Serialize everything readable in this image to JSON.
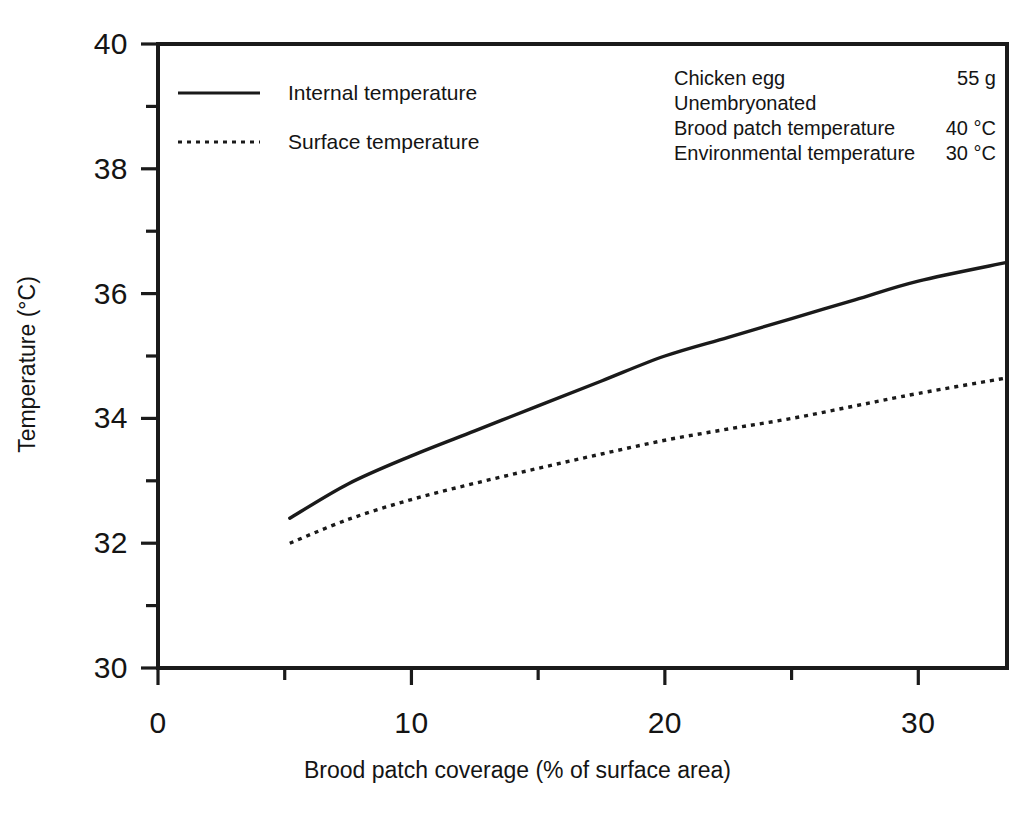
{
  "figure": {
    "background_color": "#ffffff",
    "ink_color": "#1a1a1a"
  },
  "axes": {
    "x_title": "Brood patch coverage (% of surface area)",
    "y_title": "Temperature (°C)",
    "x_tick_labels": [
      "0",
      "10",
      "20",
      "30"
    ],
    "y_tick_labels": [
      "30",
      "32",
      "34",
      "36",
      "38",
      "40"
    ]
  },
  "legend": {
    "items": [
      {
        "label": "Internal temperature",
        "style": "solid"
      },
      {
        "label": "Surface temperature",
        "style": "dotted"
      }
    ]
  },
  "annotation": {
    "rows": [
      {
        "label": "Chicken egg",
        "value": "55 g"
      },
      {
        "label": "Unembryonated",
        "value": ""
      },
      {
        "label": "Brood patch temperature",
        "value": "40 °C"
      },
      {
        "label": "Environmental temperature",
        "value": "30 °C"
      }
    ]
  },
  "chart_data": {
    "type": "line",
    "title": "",
    "xlabel": "Brood patch coverage (% of surface area)",
    "ylabel": "Temperature (°C)",
    "xlim": [
      0,
      33.5
    ],
    "ylim": [
      30,
      40
    ],
    "x_ticks": [
      0,
      10,
      20,
      30
    ],
    "x_minor_ticks": [
      5,
      15,
      25
    ],
    "y_ticks": [
      30,
      32,
      34,
      36,
      38,
      40
    ],
    "y_minor_ticks": [
      31,
      33,
      35,
      37,
      39
    ],
    "grid": false,
    "legend_position": "upper-left-inside",
    "units": {
      "x": "% of surface area",
      "y": "°C"
    },
    "conditions": {
      "sample": "Chicken egg",
      "mass": "55 g",
      "state": "Unembryonated",
      "brood_patch_temperature": "40 °C",
      "environmental_temperature": "30 °C"
    },
    "series": [
      {
        "name": "Internal temperature",
        "style": "solid",
        "x": [
          5.2,
          7.5,
          10.0,
          12.5,
          15.0,
          17.5,
          20.0,
          22.5,
          25.0,
          27.5,
          30.0,
          33.5
        ],
        "values": [
          32.4,
          32.95,
          33.4,
          33.8,
          34.2,
          34.6,
          35.0,
          35.3,
          35.6,
          35.9,
          36.2,
          36.5
        ]
      },
      {
        "name": "Surface temperature",
        "style": "dotted",
        "x": [
          5.2,
          7.5,
          10.0,
          12.5,
          15.0,
          17.5,
          20.0,
          22.5,
          25.0,
          27.5,
          30.0,
          33.5
        ],
        "values": [
          32.0,
          32.38,
          32.7,
          32.96,
          33.2,
          33.43,
          33.65,
          33.83,
          34.0,
          34.2,
          34.4,
          34.65
        ]
      }
    ]
  }
}
